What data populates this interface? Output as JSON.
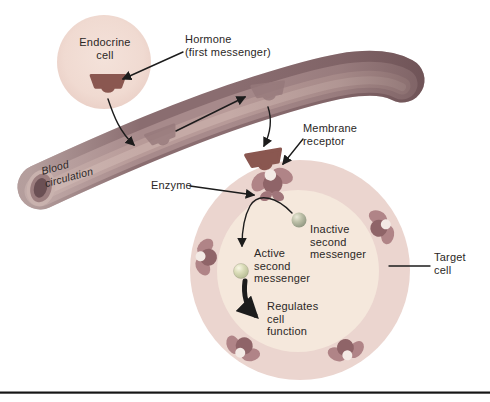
{
  "labels": {
    "endocrine_cell": "Endocrine\ncell",
    "hormone": "Hormone\n(first messenger)",
    "blood_circulation": "Blood\ncirculation",
    "membrane_receptor": "Membrane\nreceptor",
    "enzyme": "Enzyme",
    "inactive_second_messenger": "Inactive\nsecond\nmessenger",
    "active_second_messenger": "Active\nsecond\nmessenger",
    "regulates_cell_function": "Regulates\ncell\nfunction",
    "target_cell": "Target\ncell"
  },
  "colors": {
    "background": "#ffffff",
    "text": "#2b2726",
    "arrow": "#1c1c1c",
    "rule": "#161616",
    "endocrine_cell": "#f1dcd3",
    "hormone_dark": "#8a5750",
    "hormone_faded": "#96797b",
    "vessel_base": "#8a6d70",
    "vessel_mid": "#a78a8b",
    "vessel_highlight": "#b79a98",
    "vessel_core": "#c5aaa6",
    "vessel_opening_rim": "#c9b2ae",
    "vessel_opening_hole": "#6b5054",
    "receptor_light": "#b08487",
    "receptor_dark": "#8f6468",
    "receptor_notch": "#f3eae5",
    "enzyme": "#a0757a",
    "target_ring": "#ebd5cf",
    "target_cytoplasm": "#f5e8dc",
    "inactive_ball": "#9aa089",
    "active_ball": "#c9cca6"
  }
}
